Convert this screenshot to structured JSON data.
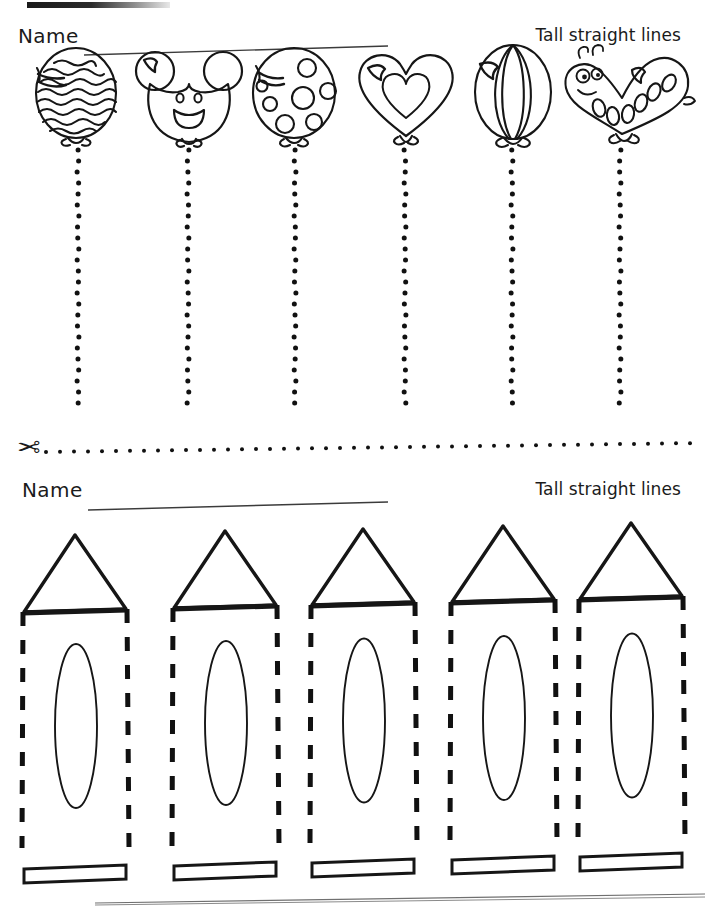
{
  "page": {
    "width": 705,
    "height": 907,
    "background": "#ffffff",
    "ink": "#161616"
  },
  "worksheet_top": {
    "name_label": "Name",
    "title": "Tall straight lines",
    "name_rule_present": true,
    "balloons": [
      {
        "index": 1,
        "style": "wavy-stripes",
        "shape": "oval",
        "label": "wavy striped balloon",
        "x": 78,
        "highlight": true
      },
      {
        "index": 2,
        "style": "mouse-face",
        "shape": "mouse",
        "label": "mouse face balloon",
        "x": 188,
        "highlight": true
      },
      {
        "index": 3,
        "style": "polka-dots",
        "shape": "oval",
        "label": "polka dot balloon",
        "x": 295,
        "highlight": true
      },
      {
        "index": 4,
        "style": "inner-heart",
        "shape": "heart",
        "label": "heart balloon",
        "x": 405,
        "highlight": true
      },
      {
        "index": 5,
        "style": "vertical-panels",
        "shape": "oval",
        "label": "paneled balloon",
        "x": 512,
        "highlight": true
      },
      {
        "index": 6,
        "style": "spots",
        "shape": "caterpillar",
        "label": "caterpillar balloon",
        "x": 620,
        "highlight": false
      }
    ],
    "trace_lines": {
      "style": "dotted",
      "count": 6,
      "dot_diameter": 5,
      "dot_spacing": 11,
      "top_y": 150,
      "bottom_y": 411,
      "color": "#111111"
    }
  },
  "cut_line": {
    "icon": "scissors-icon",
    "icon_glyph": "✂",
    "style": "dotted",
    "dot_diameter": 4,
    "dot_spacing": 14,
    "y": 448,
    "start_x": 46,
    "end_x": 700
  },
  "worksheet_bottom": {
    "name_label": "Name",
    "title": "Tall straight lines",
    "name_rule_present": true,
    "crayons": [
      {
        "index": 1,
        "x": 22,
        "width": 106,
        "tip_top_y": 535,
        "band_y": 612,
        "body_bottom_y": 848,
        "rect_y": 869
      },
      {
        "index": 2,
        "x": 172,
        "width": 106,
        "tip_top_y": 531,
        "band_y": 608,
        "body_bottom_y": 846,
        "rect_y": 866
      },
      {
        "index": 3,
        "x": 310,
        "width": 106,
        "tip_top_y": 529,
        "band_y": 605,
        "body_bottom_y": 844,
        "rect_y": 863
      },
      {
        "index": 4,
        "x": 450,
        "width": 106,
        "tip_top_y": 526,
        "band_y": 602,
        "body_bottom_y": 842,
        "rect_y": 860
      },
      {
        "index": 5,
        "x": 578,
        "width": 106,
        "tip_top_y": 523,
        "band_y": 599,
        "body_bottom_y": 840,
        "rect_y": 857
      }
    ],
    "trace_lines": {
      "style": "dashed",
      "dash_length": 14,
      "dash_gap": 14,
      "stroke_width": 5,
      "per_crayon": 2,
      "color": "#111111"
    },
    "crayon_parts": {
      "tip": "triangle",
      "band": "thick horizontal bar",
      "body_sides": "vertical dashed tracing lines",
      "center": "tall ellipse",
      "base": "thin outlined rectangle"
    }
  }
}
